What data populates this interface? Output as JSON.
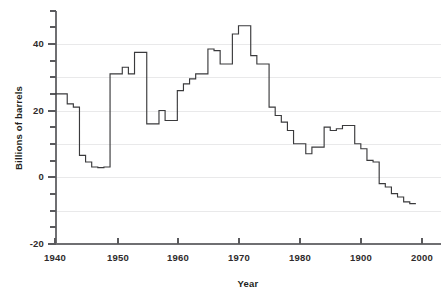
{
  "chart_data": {
    "type": "line",
    "subtype": "step-post",
    "title": "",
    "xlabel": "Year",
    "ylabel": "Billions of barrels",
    "xlim": [
      1939,
      1999
    ],
    "ylim": [
      -20,
      47
    ],
    "xticks": [
      1940,
      1950,
      1960,
      1970,
      1980,
      1900,
      2000
    ],
    "xtick_labels": [
      "1940",
      "1950",
      "1960",
      "1970",
      "1980",
      "1900",
      "2000"
    ],
    "yticks": [
      -20,
      0,
      20,
      40
    ],
    "ytick_labels": [
      "-20",
      "0",
      "20",
      "40"
    ],
    "y_minor_tick_step": 5,
    "grid": "horizontal",
    "legend": "none",
    "series": [
      {
        "name": "Billions of barrels",
        "color": "#3a3a3c",
        "x": [
          1940,
          1941,
          1942,
          1943,
          1944,
          1945,
          1946,
          1947,
          1948,
          1949,
          1950,
          1951,
          1952,
          1953,
          1954,
          1955,
          1956,
          1957,
          1958,
          1959,
          1960,
          1961,
          1962,
          1963,
          1964,
          1965,
          1966,
          1967,
          1968,
          1969,
          1970,
          1971,
          1972,
          1973,
          1974,
          1975,
          1976,
          1977,
          1978,
          1979,
          1980,
          1981,
          1982,
          1983,
          1984,
          1985,
          1986,
          1987,
          1988,
          1989,
          1990,
          1991,
          1992,
          1993,
          1994,
          1995,
          1996,
          1997,
          1998
        ],
        "values": [
          25.0,
          25.0,
          22.0,
          21.0,
          6.5,
          4.5,
          3.0,
          2.8,
          3.0,
          31.0,
          31.0,
          33.0,
          31.0,
          37.5,
          37.5,
          16.0,
          16.0,
          20.0,
          17.0,
          17.0,
          26.0,
          28.0,
          29.5,
          31.0,
          31.0,
          38.5,
          38.0,
          34.0,
          34.0,
          43.0,
          45.5,
          45.5,
          36.5,
          34.0,
          34.0,
          21.0,
          18.5,
          16.5,
          14.0,
          10.0,
          10.0,
          7.0,
          9.0,
          9.0,
          15.0,
          14.0,
          14.5,
          15.5,
          15.5,
          10.0,
          8.5,
          5.0,
          4.5,
          -2.0,
          -3.0,
          -5.0,
          -6.0,
          -7.5,
          -8.0
        ]
      }
    ],
    "note_x_units": "years"
  },
  "axes": {
    "y_axis_title": "Billions of barrels",
    "x_axis_title": "Year"
  },
  "tick_labels": {
    "y": [
      "40",
      "20",
      "0",
      "-20"
    ],
    "x": [
      "1940",
      "1950",
      "1960",
      "1970",
      "1980",
      "1900",
      "2000"
    ]
  },
  "colors": {
    "line": "#3a3a3c",
    "grid": "#e9e9ea",
    "axis": "#6f6f72",
    "text": "#231f20",
    "background": "#ffffff"
  }
}
